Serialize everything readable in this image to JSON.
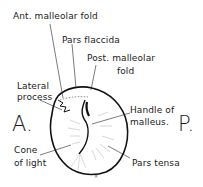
{
  "diagram": {
    "labels": {
      "ant_malleolar_fold": "Ant. malleolar fold",
      "pars_flaccida": "Pars flaccida",
      "post_malleolar_fold_1": "Post. malleolar",
      "post_malleolar_fold_2": "fold",
      "lateral_process_1": "Lateral",
      "lateral_process_2": "process",
      "handle_of_malleus_1": "Handle of",
      "handle_of_malleus_2": "malleus.",
      "cone_of_light_1": "Cone",
      "cone_of_light_2": "of light",
      "pars_tensa": "Pars tensa"
    },
    "orientation": {
      "anterior": "A.",
      "posterior": "P."
    }
  }
}
